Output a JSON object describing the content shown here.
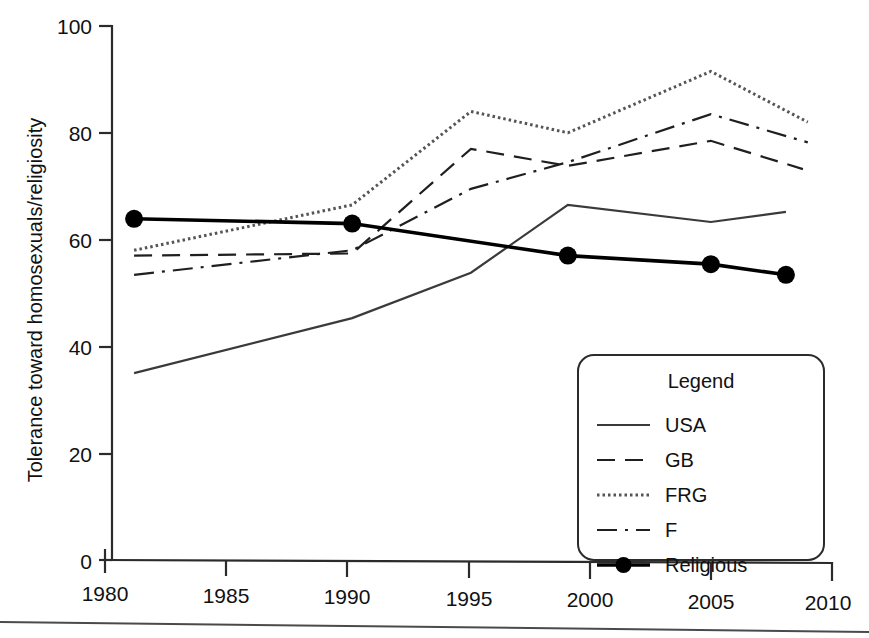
{
  "chart_data": {
    "type": "line",
    "title": "",
    "xlabel": "",
    "ylabel": "Tolerance toward homosexuals/religiosity",
    "xlim": [
      1980,
      2010
    ],
    "ylim": [
      0,
      100
    ],
    "xticks": [
      1980,
      1985,
      1990,
      1995,
      2000,
      2005,
      2010
    ],
    "yticks": [
      0,
      20,
      40,
      60,
      80,
      100
    ],
    "xtick_labels": [
      "1980",
      "1985",
      "1990",
      "1995",
      "2000",
      "2005",
      "2010"
    ],
    "ytick_labels": [
      "0",
      "20",
      "40",
      "60",
      "80",
      "100"
    ],
    "grid": false,
    "legend_position": "lower-right",
    "legend_title": "Legend",
    "series": [
      {
        "name": "USA",
        "style": "solid",
        "color": "#3a3a3a",
        "width": 2.2,
        "markers": false,
        "x": [
          1981.2,
          1990.2,
          1995.1,
          1999.1,
          2005.0,
          2008.1
        ],
        "values": [
          35.0,
          45.3,
          53.8,
          66.5,
          63.3,
          65.2
        ]
      },
      {
        "name": "GB",
        "style": "dashed",
        "color": "#1f1f1f",
        "width": 2.2,
        "markers": false,
        "x": [
          1981.2,
          1990.2,
          1995.1,
          1999.1,
          2005.0,
          2008.8
        ],
        "values": [
          57.0,
          57.4,
          77.0,
          73.8,
          78.5,
          73.2
        ]
      },
      {
        "name": "FRG",
        "style": "dotted",
        "color": "#555555",
        "width": 3.0,
        "markers": false,
        "x": [
          1981.2,
          1990.2,
          1995.1,
          1999.1,
          2005.0,
          2009.0
        ],
        "values": [
          58.0,
          66.5,
          84.0,
          80.0,
          91.5,
          82.0
        ]
      },
      {
        "name": "F",
        "style": "dashdot",
        "color": "#1f1f1f",
        "width": 2.2,
        "markers": false,
        "x": [
          1981.2,
          1990.2,
          1995.1,
          1999.1,
          2005.0,
          2009.0
        ],
        "values": [
          53.4,
          58.0,
          69.5,
          74.5,
          83.5,
          78.2
        ]
      },
      {
        "name": "Religious",
        "style": "solid-markers",
        "color": "#000000",
        "width": 3.6,
        "markers": true,
        "x": [
          1981.2,
          1990.2,
          1999.1,
          2005.0,
          2008.1
        ],
        "values": [
          63.9,
          63.0,
          57.0,
          55.4,
          53.4
        ]
      }
    ]
  },
  "legend": {
    "title": "Legend",
    "entries": [
      {
        "label": "USA",
        "style": "solid"
      },
      {
        "label": "GB",
        "style": "dashed"
      },
      {
        "label": "FRG",
        "style": "dotted"
      },
      {
        "label": "F",
        "style": "dashdot"
      },
      {
        "label": "Religious",
        "style": "solid-markers"
      }
    ]
  },
  "axes": {
    "y_title": "Tolerance toward homosexuals/religiosity"
  }
}
